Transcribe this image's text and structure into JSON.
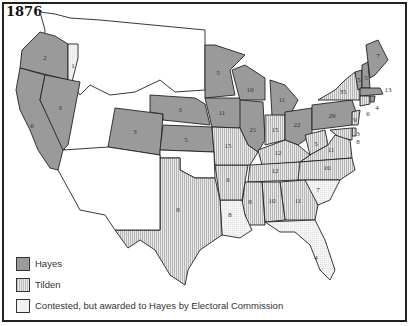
{
  "map": {
    "title": "1876",
    "colors": {
      "hayes": "#9a9a9a",
      "tilden_stripe_dark": "#bdbdbd",
      "tilden_stripe_light": "#e6e6e6",
      "contested": "#f2f2f2",
      "unassigned": "#ffffff",
      "border": "#222222"
    },
    "legend": [
      {
        "key": "hayes",
        "label": "Hayes"
      },
      {
        "key": "tilden",
        "label": "Tilden"
      },
      {
        "key": "contested",
        "label": "Contested, but awarded to Hayes by Electoral Commission"
      }
    ],
    "states": {
      "OR_hayes": "2",
      "OR_contested": "1",
      "CA": "6",
      "NV": "3",
      "CO": "3",
      "NE": "3",
      "KS": "5",
      "MN": "5",
      "IA": "11",
      "WI": "10",
      "IL": "21",
      "MI": "11",
      "IN": "15",
      "OH": "22",
      "PA": "29",
      "NY": "35",
      "VT": "5",
      "NH": "5",
      "ME": "7",
      "MA": "13",
      "RI": "4",
      "CT": "6",
      "NJ": "9",
      "DE": "3",
      "MD": "8",
      "WV": "5",
      "VA": "11",
      "NC": "10",
      "SC": "7",
      "GA": "11",
      "AL": "10",
      "MS": "8",
      "LA": "8",
      "FL": "4",
      "TX": "8",
      "AR": "6",
      "MO": "15",
      "KY": "12",
      "TN": "12"
    }
  }
}
